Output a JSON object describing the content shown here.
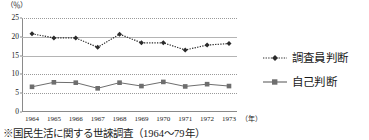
{
  "chart_data": {
    "type": "line",
    "title": "",
    "xlabel": "年",
    "ylabel": "%",
    "unit_label": "（％）",
    "xaxis_unit_label": "（年）",
    "ylim": [
      0,
      25
    ],
    "yticks": [
      0,
      5,
      10,
      15,
      20,
      25
    ],
    "ytick_labels": [
      "0",
      "5",
      "10",
      "15",
      "20",
      "25"
    ],
    "grid": true,
    "grid_style": "dotted",
    "legend_position": "right",
    "categories": [
      "1964",
      "1965",
      "1966",
      "1967",
      "1968",
      "1969",
      "1970",
      "1971",
      "1972",
      "1973"
    ],
    "series": [
      {
        "name": "調査員判断",
        "marker": "diamond",
        "line_style": "dotted",
        "color": "#2b2b2b",
        "values": [
          20.8,
          19.7,
          19.7,
          17.2,
          20.7,
          18.4,
          18.4,
          16.5,
          17.8,
          18.2
        ]
      },
      {
        "name": "自己判断",
        "marker": "square",
        "line_style": "solid",
        "color": "#6e6e6e",
        "values": [
          6.7,
          7.9,
          7.8,
          6.3,
          7.8,
          6.9,
          8.0,
          6.8,
          7.4,
          6.9
        ]
      }
    ]
  },
  "caption": {
    "text": "※国民生活に関する世誺調査（1964～79年）"
  }
}
